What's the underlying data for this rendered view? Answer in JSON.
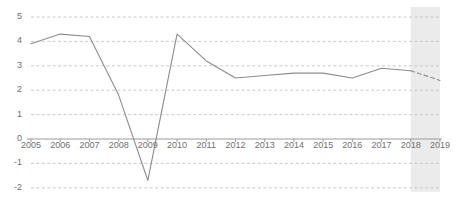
{
  "chart_data": {
    "type": "line",
    "title": "",
    "subtitle": "",
    "xlabel": "",
    "ylabel": "",
    "categories": [
      "2005",
      "2006",
      "2007",
      "2008",
      "2009",
      "2010",
      "2011",
      "2012",
      "2013",
      "2014",
      "2015",
      "2016",
      "2017",
      "2018",
      "2019"
    ],
    "x": [
      2005,
      2006,
      2007,
      2008,
      2009,
      2010,
      2011,
      2012,
      2013,
      2014,
      2015,
      2016,
      2017,
      2018,
      2019
    ],
    "values": [
      3.9,
      4.3,
      4.2,
      1.8,
      -1.7,
      4.3,
      3.2,
      2.5,
      2.6,
      2.7,
      2.7,
      2.5,
      2.9,
      2.8,
      2.4
    ],
    "series": [
      {
        "name": "series-1",
        "values": [
          3.9,
          4.3,
          4.2,
          1.8,
          -1.7,
          4.3,
          3.2,
          2.5,
          2.6,
          2.7,
          2.7,
          2.5,
          2.9,
          2.8,
          2.4
        ],
        "color": "#8c8c8c",
        "solid_until_index": 13,
        "dashed_from_index": 13
      }
    ],
    "ylim": [
      -2,
      5
    ],
    "xlim": [
      2005,
      2019
    ],
    "yticks": [
      5,
      4,
      3,
      2,
      1,
      0,
      -1,
      -2
    ],
    "ytick_labels": [
      "5",
      "4",
      "3",
      "2",
      "1",
      "0",
      "-1",
      "-2"
    ],
    "xticks": [
      2005,
      2006,
      2007,
      2008,
      2009,
      2010,
      2011,
      2012,
      2013,
      2014,
      2015,
      2016,
      2017,
      2018,
      2019
    ],
    "xtick_labels": [
      "2005",
      "2006",
      "2007",
      "2008",
      "2009",
      "2010",
      "2011",
      "2012",
      "2013",
      "2014",
      "2015",
      "2016",
      "2017",
      "2018",
      "2019"
    ],
    "grid": true,
    "grid_style": "dashed",
    "grid_color": "#bfbfbf",
    "zero_axis_color": "#9a9a9a",
    "legend": null,
    "legend_position": "none",
    "shaded_regions": [
      {
        "name": "forecast-band",
        "x_start": 2018,
        "x_end": 2019,
        "color": "#ebebeb"
      }
    ],
    "annotations": []
  },
  "axis": {
    "y_labels": [
      "5",
      "4",
      "3",
      "2",
      "1",
      "0",
      "-1",
      "-2"
    ],
    "x_labels": [
      "2005",
      "2006",
      "2007",
      "2008",
      "2009",
      "2010",
      "2011",
      "2012",
      "2013",
      "2014",
      "2015",
      "2016",
      "2017",
      "2018",
      "2019"
    ]
  }
}
